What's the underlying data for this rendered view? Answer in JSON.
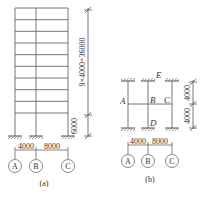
{
  "figure_a": {
    "caption": "(a)",
    "vertical_dim_upper": "9×4000=36000",
    "vertical_dim_lower": "6000",
    "span_dims": [
      "4000",
      "8000"
    ],
    "axis_labels": [
      "A",
      "B",
      "C"
    ],
    "stories_upper": 9
  },
  "figure_b": {
    "caption": "(b)",
    "node_labels": {
      "A": "A",
      "B": "B",
      "C": "C",
      "D": "D",
      "E": "E"
    },
    "vertical_dims": [
      "4000",
      "4000"
    ],
    "vertical_dim_text": "4000 4000",
    "span_dims": [
      "4000",
      "8000"
    ],
    "axis_labels": [
      "A",
      "B",
      "C"
    ]
  },
  "colors": {
    "line": "#555555",
    "text": "#333333"
  }
}
